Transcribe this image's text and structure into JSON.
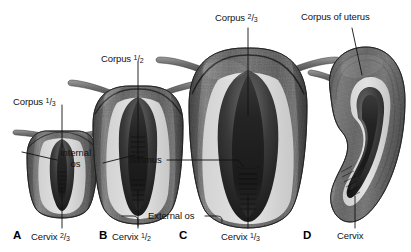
{
  "figure": {
    "background_color": "#ffffff",
    "ink_color": "#111111"
  },
  "panels": [
    {
      "letter": "A",
      "top_label": "Corpus",
      "top_fraction_num": "1",
      "top_fraction_den": "3",
      "bottom_label": "Cervix",
      "bottom_fraction_num": "2",
      "bottom_fraction_den": "3",
      "view": "coronal-section",
      "description": "infantile uterus"
    },
    {
      "letter": "B",
      "top_label": "Corpus",
      "top_fraction_num": "1",
      "top_fraction_den": "2",
      "bottom_label": "Cervix",
      "bottom_fraction_num": "1",
      "bottom_fraction_den": "2",
      "view": "coronal-section",
      "description": "pubertal uterus"
    },
    {
      "letter": "C",
      "top_label": "Corpus",
      "top_fraction_num": "2",
      "top_fraction_den": "3",
      "bottom_label": "Cervix",
      "bottom_fraction_num": "1",
      "bottom_fraction_den": "3",
      "view": "coronal-section",
      "description": "adult uterus"
    },
    {
      "letter": "D",
      "top_label": "Corpus of uterus",
      "bottom_label": "Cervix",
      "view": "sagittal-section",
      "description": "anteflexed adult uterus in sagittal section"
    }
  ],
  "callouts": [
    {
      "id": "internal-os",
      "line1": "Internal",
      "line2": "os"
    },
    {
      "id": "isthmus",
      "text": "Isthmus"
    },
    {
      "id": "external-os",
      "text": "External os"
    }
  ]
}
